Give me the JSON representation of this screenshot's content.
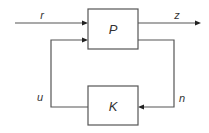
{
  "diagram": {
    "type": "block-diagram",
    "title": "",
    "blocks": [
      {
        "id": "P",
        "label": "P"
      },
      {
        "id": "K",
        "label": "K"
      }
    ],
    "signals": [
      {
        "id": "r",
        "label": "r",
        "from": "external",
        "to": "P"
      },
      {
        "id": "z",
        "label": "z",
        "from": "P",
        "to": "external"
      },
      {
        "id": "n",
        "label": "n",
        "from": "P",
        "to": "K"
      },
      {
        "id": "u",
        "label": "u",
        "from": "K",
        "to": "P"
      }
    ]
  }
}
